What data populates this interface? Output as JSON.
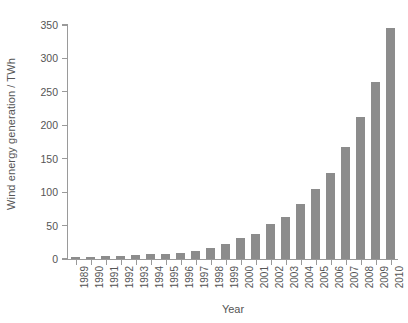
{
  "chart_data": {
    "type": "bar",
    "title": "",
    "xlabel": "Year",
    "ylabel": "Wind energy generation / TWh",
    "categories": [
      "1989",
      "1990",
      "1991",
      "1992",
      "1993",
      "1994",
      "1995",
      "1996",
      "1997",
      "1998",
      "1999",
      "2000",
      "2001",
      "2002",
      "2003",
      "2004",
      "2005",
      "2006",
      "2007",
      "2008",
      "2009",
      "2010"
    ],
    "values": [
      3,
      3.5,
      4,
      4.5,
      5.5,
      7,
      8,
      9,
      12,
      16,
      22,
      31,
      38,
      52,
      63,
      83,
      104,
      129,
      167,
      213,
      265,
      345
    ],
    "ylim": [
      0,
      350
    ],
    "yticks": [
      0,
      50,
      100,
      150,
      200,
      250,
      300,
      350
    ],
    "ytick_labels": [
      "0",
      "50",
      "100",
      "150",
      "200",
      "250",
      "300",
      "350"
    ],
    "grid": false,
    "legend": false,
    "bar_color": "#8c8c8c",
    "axis_color": "#9a9a9a",
    "text_color": "#555555",
    "background": "#ffffff"
  }
}
